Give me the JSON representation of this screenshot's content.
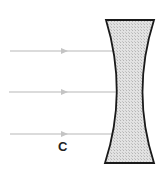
{
  "diagram": {
    "type": "concave-lens-ray-diagram",
    "lens": {
      "kind": "diverging (biconcave) lens",
      "fill": "#d9d9d9",
      "stroke": "#1a1a1a"
    },
    "rays": [
      {
        "y": 51,
        "direction": "right"
      },
      {
        "y": 92,
        "direction": "right"
      },
      {
        "y": 134,
        "direction": "right"
      }
    ],
    "ray_color": "#c8c8c8",
    "labels": {
      "point_c": "C"
    }
  }
}
